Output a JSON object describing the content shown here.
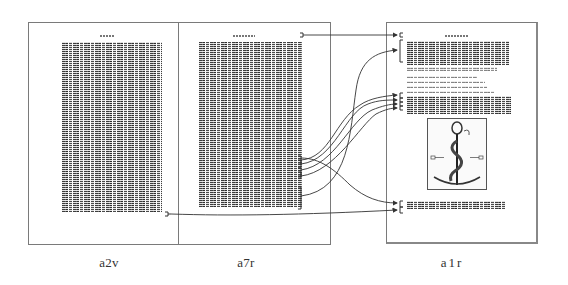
{
  "figure": {
    "pages": [
      {
        "id": "a2v",
        "label": "a2v"
      },
      {
        "id": "a7r",
        "label": "a7r"
      },
      {
        "id": "a1r",
        "label": "a1r"
      }
    ],
    "links": [
      {
        "from": "a7r header",
        "to": "a1r header"
      },
      {
        "from": "a7r bracket group",
        "to": "a1r opening paragraph"
      },
      {
        "from": "a7r bracket group",
        "to": "a1r middle paragraph line 1"
      },
      {
        "from": "a7r bracket group",
        "to": "a1r middle paragraph line 2"
      },
      {
        "from": "a7r bracket group",
        "to": "a1r middle paragraph line 3"
      },
      {
        "from": "a7r bracket group",
        "to": "a1r middle paragraph line 4"
      },
      {
        "from": "a7r bracket group",
        "to": "a1r bottom paragraph"
      },
      {
        "from": "a2v bottom line",
        "to": "a1r bottom paragraph line 2"
      }
    ],
    "colors": {
      "line": "#333333",
      "border": "#7a7a7a",
      "text": "#222222"
    }
  }
}
